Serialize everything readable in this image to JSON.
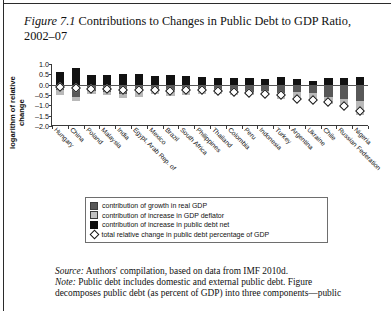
{
  "figure": {
    "number": "Figure 7.1",
    "title": " Contributions to Changes in Public Debt to GDP Ratio, 2002–07"
  },
  "legend": {
    "items": [
      {
        "marker": "square-dark-gray",
        "label": "contribution of growth in real GDP"
      },
      {
        "marker": "square-light-gray",
        "label": "contribution of increase in GDP deflator"
      },
      {
        "marker": "square-black",
        "label": "contribution of increase in public debt net"
      },
      {
        "marker": "diamond-open",
        "label": "total relative change in public debt percentage of GDP"
      }
    ]
  },
  "footnotes": {
    "source_label": "Source:",
    "source_text": " Authors' compilation, based on data from IMF 2010d.",
    "note_label": "Note:",
    "note_text": " Public debt includes domestic and external public debt. Figure",
    "note_text2": "decomposes public debt (as percent of GDP) into three components—public"
  },
  "chart_data": {
    "type": "bar",
    "subtype": "stacked-bar-with-marker",
    "title": "Contributions to Changes in Public Debt to GDP Ratio, 2002–07",
    "xlabel": "",
    "ylabel": "logarithm of relative change",
    "ylim": [
      -2.0,
      1.0
    ],
    "yticks": [
      1.0,
      0.5,
      0.0,
      -0.5,
      -1.0,
      -1.5,
      -2.0
    ],
    "ytick_labels": [
      "1.0",
      "0.5",
      "0.0",
      "–0.5",
      "–1.0",
      "–1.5",
      "–2.0"
    ],
    "grid": false,
    "legend_position": "below-axes",
    "categories": [
      "Hungary",
      "China",
      "Poland",
      "Malaysia",
      "India",
      "Egypt, Arab Rep. of",
      "Mexico",
      "Brazil",
      "South Africa",
      "Philippines",
      "Thailand",
      "Colombia",
      "Peru",
      "Indonesia",
      "Turkey",
      "Argentina",
      "Ukraine",
      "Chile",
      "Russian Federation",
      "Nigeria"
    ],
    "series": [
      {
        "name": "contribution of increase in public debt net",
        "color": "#121212",
        "values": [
          0.6,
          0.82,
          0.45,
          0.47,
          0.52,
          0.52,
          0.4,
          0.47,
          0.44,
          0.36,
          0.34,
          0.33,
          0.31,
          0.29,
          0.36,
          0.27,
          0.18,
          0.3,
          0.33,
          0.38
        ]
      },
      {
        "name": "contribution of growth in real GDP",
        "color": "#585858",
        "values": [
          -0.28,
          -0.6,
          -0.3,
          -0.37,
          -0.47,
          -0.31,
          -0.23,
          -0.28,
          -0.29,
          -0.28,
          -0.33,
          -0.3,
          -0.34,
          -0.3,
          -0.4,
          -0.37,
          -0.4,
          -0.62,
          -0.7,
          -0.78
        ]
      },
      {
        "name": "contribution of increase in GDP deflator",
        "color": "#b9b9b9",
        "values": [
          -0.22,
          -0.18,
          -0.17,
          -0.11,
          -0.16,
          -0.28,
          -0.2,
          -0.28,
          -0.2,
          -0.15,
          -0.13,
          -0.18,
          -0.18,
          -0.22,
          -0.28,
          -0.38,
          -0.32,
          -0.3,
          -0.45,
          -0.68
        ]
      }
    ],
    "marker_series": {
      "name": "total relative change in public debt percentage of GDP",
      "marker": "diamond-open",
      "values": [
        0.12,
        0.06,
        0.02,
        0.01,
        -0.06,
        -0.04,
        -0.02,
        -0.07,
        -0.04,
        -0.06,
        -0.1,
        -0.14,
        -0.19,
        -0.22,
        -0.3,
        -0.46,
        -0.52,
        -0.6,
        -0.8,
        -1.05
      ]
    }
  }
}
